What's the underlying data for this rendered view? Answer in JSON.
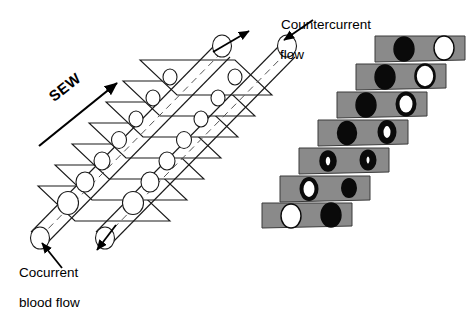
{
  "figure": {
    "background_color": "#ffffff",
    "labels": {
      "countercurrent_line1": "Countercurrent",
      "countercurrent_line2": "flow",
      "cocurrent_line1": "Cocurrent",
      "cocurrent_line2": "blood flow",
      "sew": "SEW"
    },
    "colors": {
      "bar_fill": "#8a8a8a",
      "bar_stroke": "#3a3a3a",
      "ink": "#000000",
      "lamella_fill": "#ffffff",
      "lamella_stroke": "#1a1a1a",
      "circle_dark": "#0a0a0a",
      "circle_light": "#ffffff"
    },
    "left_panel": {
      "name": "lamellae-stack",
      "description": "Stack of seven gill lamellae sheets with capillaries running diagonally through them",
      "lamella_count": 7,
      "capillary_count": 2,
      "arrows": [
        {
          "name": "cocurrent-inflow-arrow",
          "direction": "down-left",
          "label": "Cocurrent blood flow"
        },
        {
          "name": "cocurrent-outflow-arrow",
          "direction": "down-left",
          "label": "Cocurrent blood flow"
        },
        {
          "name": "countercurrent-water-arrow",
          "direction": "up-right",
          "label": "Countercurrent flow"
        },
        {
          "name": "countercurrent-inflow-arrow",
          "direction": "down-left",
          "label": "Countercurrent flow"
        },
        {
          "name": "sew-arrow",
          "direction": "up-right",
          "label": "SEW"
        }
      ]
    },
    "right_panel": {
      "name": "oxygen-gradient-series",
      "description": "Seven gray lamella sections showing progressive oxygen exchange between two capillaries",
      "bar_count": 7,
      "bars": [
        {
          "index": 1,
          "left_circle": "black",
          "right_circle": "white",
          "left_fill": 1.0,
          "right_fill": 0.0
        },
        {
          "index": 2,
          "left_circle": "black",
          "right_circle": "near-white",
          "left_fill": 1.0,
          "right_fill": 0.12
        },
        {
          "index": 3,
          "left_circle": "black",
          "right_circle": "mostly-white",
          "left_fill": 0.95,
          "right_fill": 0.3
        },
        {
          "index": 4,
          "left_circle": "black",
          "right_circle": "half-black",
          "left_fill": 0.92,
          "right_fill": 0.62
        },
        {
          "index": 5,
          "left_circle": "mostly-black",
          "right_circle": "mostly-black",
          "left_fill": 0.68,
          "right_fill": 0.78
        },
        {
          "index": 6,
          "left_circle": "half-white",
          "right_circle": "mostly-black",
          "left_fill": 0.35,
          "right_fill": 0.88
        },
        {
          "index": 7,
          "left_circle": "white",
          "right_circle": "black",
          "left_fill": 0.0,
          "right_fill": 1.0
        }
      ]
    }
  }
}
